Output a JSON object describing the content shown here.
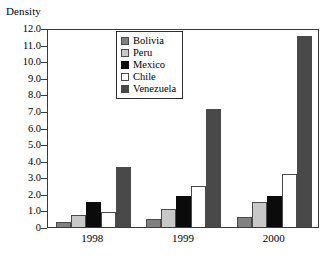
{
  "chart_data": {
    "type": "bar",
    "title": "",
    "xlabel": "",
    "ylabel": "Density",
    "categories": [
      "1998",
      "1999",
      "2000"
    ],
    "ylim": [
      0,
      12.0
    ],
    "ytick_labels": [
      "12.0",
      "11.0",
      "10.0",
      "9.0",
      "8.0",
      "7.0",
      "6.0",
      "5.0",
      "4.0",
      "3.0",
      "2.0",
      "1.0",
      "0"
    ],
    "ytick_values": [
      12.0,
      11.0,
      10.0,
      9.0,
      8.0,
      7.0,
      6.0,
      5.0,
      4.0,
      3.0,
      2.0,
      1.0,
      0
    ],
    "grid": false,
    "legend_position": "top-center",
    "series": [
      {
        "name": "Bolivia",
        "color": "#808080",
        "values": [
          0.3,
          0.5,
          0.6
        ]
      },
      {
        "name": "Peru",
        "color": "#c8c8c8",
        "values": [
          0.7,
          1.1,
          1.5
        ]
      },
      {
        "name": "Mexico",
        "color": "#0b0b0b",
        "values": [
          1.5,
          1.9,
          1.9
        ]
      },
      {
        "name": "Chile",
        "color": "#ffffff",
        "values": [
          0.9,
          2.5,
          3.2
        ]
      },
      {
        "name": "Venezuela",
        "color": "#494949",
        "values": [
          3.6,
          7.1,
          11.5
        ]
      }
    ]
  }
}
